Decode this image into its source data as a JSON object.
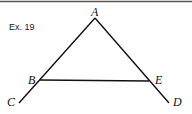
{
  "exercise_label": "Ex. 19",
  "points": {
    "A": {
      "label": "A",
      "x": 95,
      "y": 18
    },
    "B": {
      "label": "B",
      "x": 40,
      "y": 80
    },
    "E": {
      "label": "E",
      "x": 149,
      "y": 81
    },
    "C": {
      "label": "C",
      "x": 19,
      "y": 103
    },
    "D": {
      "label": "D",
      "x": 169,
      "y": 103
    }
  },
  "segments": [
    [
      "A",
      "C"
    ],
    [
      "A",
      "D"
    ],
    [
      "B",
      "E"
    ]
  ],
  "colors": {
    "line": "#111111",
    "top_rule": "#555555"
  }
}
